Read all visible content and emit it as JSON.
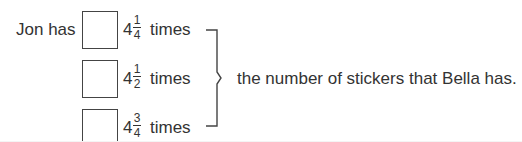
{
  "question": {
    "lead": "Jon has",
    "options": [
      {
        "whole": "4",
        "numerator": "1",
        "denominator": "4",
        "word": "times"
      },
      {
        "whole": "4",
        "numerator": "1",
        "denominator": "2",
        "word": "times"
      },
      {
        "whole": "4",
        "numerator": "3",
        "denominator": "4",
        "word": "times"
      }
    ],
    "conclusion": "the number of stickers that Bella has."
  }
}
